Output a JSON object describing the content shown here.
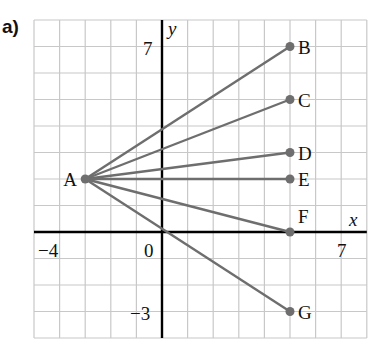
{
  "part_label": "a)",
  "axes": {
    "x_label": "x",
    "y_label": "y",
    "x_range": [
      -5,
      8
    ],
    "y_range": [
      -4,
      8
    ],
    "tick_labels": {
      "x_min": "−4",
      "origin": "0",
      "x_max": "7",
      "y_max": "7",
      "y_min": "−3"
    }
  },
  "colors": {
    "grid": "#c8c8c8",
    "axis": "#000000",
    "segment": "#6e6e6e",
    "point": "#6e6e6e"
  },
  "points": [
    {
      "name": "A",
      "x": -3,
      "y": 2
    },
    {
      "name": "B",
      "x": 5,
      "y": 7
    },
    {
      "name": "C",
      "x": 5,
      "y": 5
    },
    {
      "name": "D",
      "x": 5,
      "y": 3
    },
    {
      "name": "E",
      "x": 5,
      "y": 2
    },
    {
      "name": "F",
      "x": 5,
      "y": 0
    },
    {
      "name": "G",
      "x": 5,
      "y": -3
    }
  ],
  "segments": [
    [
      "A",
      "B"
    ],
    [
      "A",
      "C"
    ],
    [
      "A",
      "D"
    ],
    [
      "A",
      "E"
    ],
    [
      "A",
      "F"
    ],
    [
      "A",
      "G"
    ]
  ]
}
